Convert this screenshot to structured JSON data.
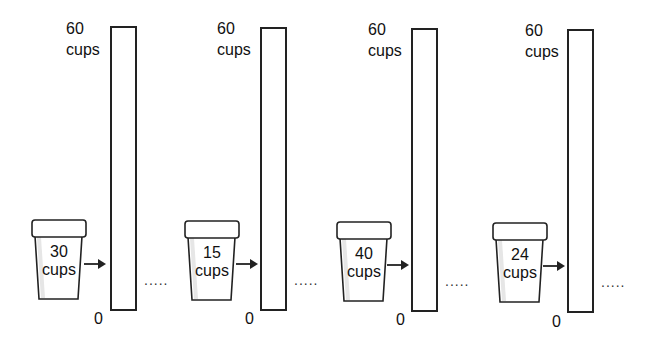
{
  "diagram": {
    "type": "cups-to-scale-bars",
    "scale": {
      "max_label": "60",
      "unit_label": "cups",
      "min_label": "0"
    },
    "continuation_marker": ".....",
    "panels": [
      {
        "cup_value": "30",
        "cup_unit": "cups",
        "top_value": "60",
        "top_unit": "cups",
        "zero": "0",
        "dots": "....."
      },
      {
        "cup_value": "15",
        "cup_unit": "cups",
        "top_value": "60",
        "top_unit": "cups",
        "zero": "0",
        "dots": "....."
      },
      {
        "cup_value": "40",
        "cup_unit": "cups",
        "top_value": "60",
        "top_unit": "cups",
        "zero": "0",
        "dots": "....."
      },
      {
        "cup_value": "24",
        "cup_unit": "cups",
        "top_value": "60",
        "top_unit": "cups",
        "zero": "0",
        "dots": "....."
      }
    ],
    "colors": {
      "stroke": "#222222",
      "cup_shade": "#e6e6e6",
      "background": "#ffffff"
    }
  }
}
